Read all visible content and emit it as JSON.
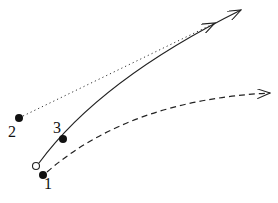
{
  "diagram": {
    "labels": {
      "p1": "1",
      "p2": "2",
      "p3": "3"
    },
    "points": [
      {
        "id": "1",
        "x": 43,
        "y": 175,
        "style": "filled"
      },
      {
        "id": "2",
        "x": 19,
        "y": 118,
        "style": "filled"
      },
      {
        "id": "3",
        "x": 63,
        "y": 139,
        "style": "filled"
      },
      {
        "id": "origin",
        "x": 36,
        "y": 166,
        "style": "open"
      }
    ],
    "paths": [
      {
        "name": "solid-trajectory",
        "style": "solid",
        "from": "origin",
        "to": [
          241,
          10
        ]
      },
      {
        "name": "dotted-trajectory",
        "style": "dotted",
        "from": "2",
        "to": [
          215,
          23
        ]
      },
      {
        "name": "dashed-trajectory",
        "style": "dashed",
        "from": "1",
        "to": [
          270,
          93
        ]
      }
    ],
    "colors": {
      "ink": "#222222",
      "background": "#ffffff"
    }
  }
}
